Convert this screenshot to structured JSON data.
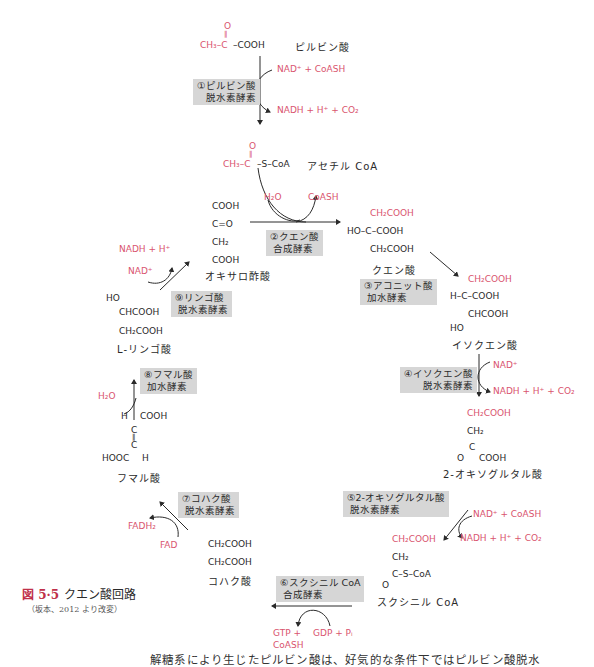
{
  "figure": {
    "number": "図 5·5",
    "title": "クエン酸回路",
    "source": "（坂本、2012 より改変）"
  },
  "colors": {
    "highlight": "#d9546e",
    "enzyme_box": "#d6d6d6",
    "text": "#2a2a2a",
    "figure_number": "#c0304a"
  },
  "compounds": {
    "pyruvate": {
      "name": "ピルビン酸",
      "red": "CH₃–C",
      "black": "–COOH",
      "carbonyl": "O"
    },
    "acetyl_coa": {
      "name": "アセチル CoA",
      "red": "CH₃–C",
      "black": "–S–CoA",
      "carbonyl": "O"
    },
    "oxaloacetate": {
      "name": "オキサロ酢酸",
      "l1": "COOH",
      "l2": "C=O",
      "l3": "CH₂",
      "l4": "COOH"
    },
    "citrate": {
      "name": "クエン酸",
      "l1": "CH₂COOH",
      "l2": "HO–C–COOH",
      "l3": "CH₂COOH"
    },
    "isocitrate": {
      "name": "イソクエン酸",
      "l1": "CH₂COOH",
      "l2": "H–C–COOH",
      "l3": "CHCOOH",
      "l4": "HO"
    },
    "oxoglutarate": {
      "name": "2-オキソグルタル酸",
      "l1": "CH₂COOH",
      "l2": "CH₂",
      "l3": "C",
      "l4": "O",
      "l5": "COOH"
    },
    "succinyl_coa": {
      "name": "スクシニル CoA",
      "l1": "CH₂COOH",
      "l2": "CH₂",
      "l3": "C–S–CoA",
      "l4": "O"
    },
    "succinate": {
      "name": "コハク酸",
      "l1": "CH₂COOH",
      "l2": "CH₂COOH"
    },
    "fumarate": {
      "name": "フマル酸",
      "l1a": "H",
      "l1b": "COOH",
      "l2": "C",
      "l3": "C",
      "l4a": "HOOC",
      "l4b": "H"
    },
    "malate": {
      "name": "L-リンゴ酸",
      "l1": "HO",
      "l2": "CHCOOH",
      "l3": "CH₂COOH"
    }
  },
  "enzymes": [
    {
      "id": 1,
      "line1": "①ピルビン酸",
      "line2": "脱水素酵素"
    },
    {
      "id": 2,
      "line1": "②クエン酸",
      "line2": "合成酵素"
    },
    {
      "id": 3,
      "line1": "③アコニット酸",
      "line2": "加水酵素"
    },
    {
      "id": 4,
      "line1": "④イソクエン酸",
      "line2": "脱水素酵素"
    },
    {
      "id": 5,
      "line1": "⑤2-オキソグルタル酸",
      "line2": "脱水素酵素"
    },
    {
      "id": 6,
      "line1": "⑥スクシニル CoA",
      "line2": "合成酵素"
    },
    {
      "id": 7,
      "line1": "⑦コハク酸",
      "line2": "脱水素酵素"
    },
    {
      "id": 8,
      "line1": "⑧フマル酸",
      "line2": "加水酵素"
    },
    {
      "id": 9,
      "line1": "⑨リンゴ酸",
      "line2": "脱水素酵素"
    }
  ],
  "cofactors": {
    "s1_in": "NAD⁺ + CoASH",
    "s1_out": "NADH + H⁺ + CO₂",
    "s2_in": "H₂O",
    "s2_out": "CoASH",
    "s4_in": "NAD⁺",
    "s4_out": "NADH + H⁺ + CO₂",
    "s5_in": "NAD⁺ + CoASH",
    "s5_out": "NADH + H⁺ + CO₂",
    "s6_in": "GDP + Pᵢ",
    "s6_out_1": "GTP +",
    "s6_out_2": "CoASH",
    "s7_in": "FAD",
    "s7_out": "FADH₂",
    "s8_in": "H₂O",
    "s9_in": "NAD⁺",
    "s9_out": "NADH + H⁺"
  },
  "body_text": "解糖系により生じたピルビン酸は、好気的な条件下ではピルビン酸脱水"
}
